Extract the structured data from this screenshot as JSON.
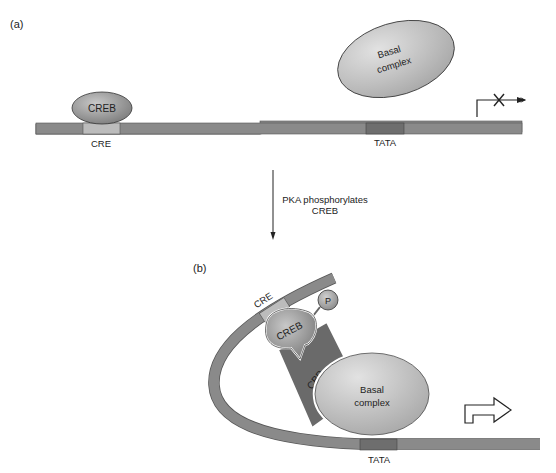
{
  "panel_a": {
    "label": "(a)",
    "creb": "CREB",
    "cre": "CRE",
    "basal_line1": "Basal",
    "basal_line2": "complex",
    "tata": "TATA"
  },
  "transition": {
    "line1": "PKA phosphorylates",
    "line2": "CREB"
  },
  "panel_b": {
    "label": "(b)",
    "cre": "CRE",
    "p": "P",
    "creb": "CREB",
    "cbp": "CBP",
    "basal_line1": "Basal",
    "basal_line2": "complex",
    "tata": "TATA"
  },
  "colors": {
    "dna": "#8a8a8a",
    "cre": "#b9b9b9",
    "tata": "#6e6e6e",
    "creb": "#8f8f8f",
    "basal": "#b5b5b5",
    "cbp": "#6a6a6a"
  }
}
